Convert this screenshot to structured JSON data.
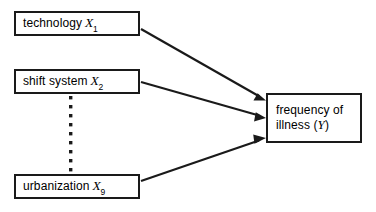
{
  "diagram": {
    "type": "path-diagram",
    "title": "",
    "ink_color": "#1a1a1a",
    "background_color": "#ffffff",
    "nodes": [
      {
        "id": "x1",
        "name": "technology",
        "label": "technology",
        "symbol": "X",
        "subscript": "1",
        "role": "predictor"
      },
      {
        "id": "x2",
        "name": "shift system",
        "label": "shift system",
        "symbol": "X",
        "subscript": "2",
        "role": "predictor"
      },
      {
        "id": "x9",
        "name": "urbanization",
        "label": "urbanization",
        "symbol": "X",
        "subscript": "9",
        "role": "predictor"
      },
      {
        "id": "y",
        "name": "frequency of illness",
        "line1": "frequency of",
        "line2_prefix": "illness (",
        "line2_symbol": "Y",
        "line2_suffix": ")",
        "role": "outcome"
      }
    ],
    "ellipsis": {
      "name": "vertical-dots",
      "style": "dotted",
      "between": [
        "x2",
        "x9"
      ],
      "dot_count": 9
    },
    "edges": [
      {
        "from": "x1",
        "to": "y",
        "arrowhead": true
      },
      {
        "from": "x2",
        "to": "y",
        "arrowhead": true
      },
      {
        "from": "x9",
        "to": "y",
        "arrowhead": true
      }
    ]
  }
}
